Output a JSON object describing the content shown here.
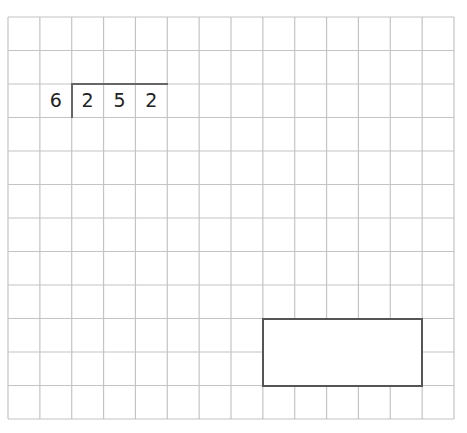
{
  "worksheet": {
    "grid": {
      "columns": 14,
      "rows": 12,
      "left": 8,
      "top": 17,
      "right": 454,
      "bottom": 419,
      "line_color": "#c4c4c4"
    },
    "division": {
      "divisor": "6",
      "dividend_digits": [
        "2",
        "5",
        "2"
      ],
      "row": 2,
      "divisor_col": 1,
      "dividend_start_col": 2
    },
    "answer_box": {
      "col_start": 8,
      "col_end": 13,
      "row_start": 9,
      "row_end": 11,
      "value": ""
    }
  }
}
